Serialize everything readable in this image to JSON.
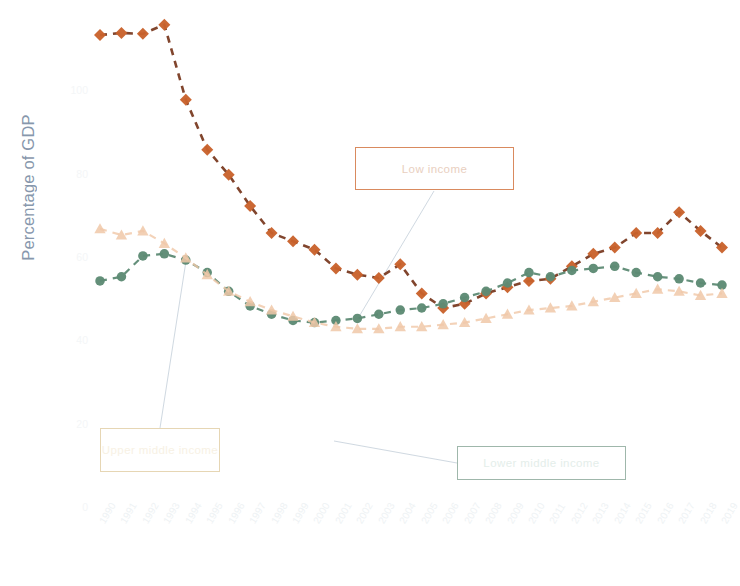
{
  "axes": {
    "ylabel": "Percentage of GDP",
    "ylabel_color": "#7d8fa6",
    "xlabel": ""
  },
  "callouts": [
    {
      "id": "low",
      "label": "Low income",
      "border_color": "#d98a5e",
      "text_color": "#e9cfc0"
    },
    {
      "id": "lowermid",
      "label": "Lower middle income",
      "border_color": "#9fb7ab",
      "text_color": "#e4eeea"
    },
    {
      "id": "uppermid",
      "label": "Upper middle income",
      "border_color": "#e6d6b4",
      "text_color": "#f7f1e4"
    }
  ],
  "colors": {
    "low_income": "#c9622c",
    "low_income_line": "#7a3b22",
    "lower_middle_income": "#5d8a74",
    "upper_middle_income": "#f0c8a8",
    "leader_line": "#b9c6d2",
    "background": "#ffffff"
  },
  "chart_data": {
    "type": "line",
    "title": "",
    "xlabel": "",
    "ylabel": "Percentage of GDP",
    "grid": false,
    "legend_position": "callout-boxes",
    "xlim": [
      1990,
      2019
    ],
    "ylim": [
      0,
      120
    ],
    "yticks": [
      0,
      20,
      40,
      60,
      80,
      100
    ],
    "ytick_labels": [
      "0",
      "20",
      "40",
      "60",
      "80",
      "100"
    ],
    "x": [
      1990,
      1991,
      1992,
      1993,
      1994,
      1995,
      1996,
      1997,
      1998,
      1999,
      2000,
      2001,
      2002,
      2003,
      2004,
      2005,
      2006,
      2007,
      2008,
      2009,
      2010,
      2011,
      2012,
      2013,
      2014,
      2015,
      2016,
      2017,
      2018,
      2019
    ],
    "categories": [
      "1990",
      "1991",
      "1992",
      "1993",
      "1994",
      "1995",
      "1996",
      "1997",
      "1998",
      "1999",
      "2000",
      "2001",
      "2002",
      "2003",
      "2004",
      "2005",
      "2006",
      "2007",
      "2008",
      "2009",
      "2010",
      "2011",
      "2012",
      "2013",
      "2014",
      "2015",
      "2016",
      "2017",
      "2018",
      "2019"
    ],
    "series": [
      {
        "name": "Low income",
        "marker": "diamond",
        "linestyle": "dashed",
        "color": "#c9622c",
        "values": [
          113.5,
          114.0,
          113.8,
          116.0,
          98.0,
          86.0,
          80.0,
          72.5,
          66.0,
          64.0,
          62.0,
          57.5,
          56.0,
          55.2,
          58.5,
          51.5,
          48.0,
          49.0,
          51.5,
          53.0,
          54.5,
          55.0,
          58.0,
          61.0,
          62.5,
          66.0,
          66.0,
          71.0,
          66.5,
          62.5
        ]
      },
      {
        "name": "Lower middle income",
        "marker": "circle",
        "linestyle": "dashed",
        "color": "#5d8a74",
        "values": [
          54.5,
          55.5,
          60.5,
          61.0,
          59.5,
          56.5,
          52.0,
          48.5,
          46.5,
          45.0,
          44.5,
          45.0,
          45.5,
          46.5,
          47.5,
          48.0,
          49.0,
          50.5,
          52.0,
          54.0,
          56.5,
          55.5,
          57.0,
          57.5,
          58.0,
          56.5,
          55.5,
          55.0,
          54.0,
          53.5
        ]
      },
      {
        "name": "Upper middle income",
        "marker": "triangle",
        "linestyle": "dashed",
        "color": "#f0c8a8",
        "values": [
          67.0,
          65.5,
          66.5,
          63.5,
          60.0,
          56.0,
          52.0,
          49.5,
          47.5,
          46.0,
          44.5,
          43.5,
          43.0,
          43.0,
          43.5,
          43.5,
          44.0,
          44.5,
          45.5,
          46.5,
          47.5,
          48.0,
          48.5,
          49.5,
          50.5,
          51.5,
          52.5,
          52.0,
          51.0,
          51.5
        ]
      }
    ]
  }
}
